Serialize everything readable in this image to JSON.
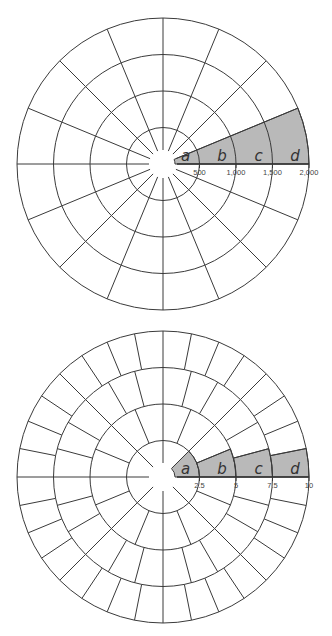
{
  "diagrams": [
    {
      "id": "equal-angle-grid",
      "center": [
        163,
        164
      ],
      "ring_radii_px": [
        36.5,
        73,
        109.5,
        146
      ],
      "gap_radius_px": 14,
      "spoke_divisions_per_ring": [
        16,
        16,
        16,
        16
      ],
      "shaded_sector_deg": [
        0,
        22.5
      ],
      "shaded_mode": "full-wedge",
      "segment_labels": [
        "a",
        "b",
        "c",
        "d"
      ],
      "scale_labels": [
        "500",
        "1,000",
        "1,500",
        "2,000"
      ]
    },
    {
      "id": "equal-area-grid",
      "center": [
        163,
        477
      ],
      "ring_radii_px": [
        36.5,
        73,
        109.5,
        146
      ],
      "gap_radius_px": 14,
      "spoke_divisions_per_ring": [
        8,
        16,
        24,
        32
      ],
      "shaded_sector_deg": [
        0,
        45
      ],
      "shaded_mode": "first-cell-per-ring",
      "segment_labels": [
        "a",
        "b",
        "c",
        "d"
      ],
      "scale_labels": [
        "2.5",
        "5",
        "7.5",
        "10"
      ]
    }
  ],
  "colors": {
    "line": "#3a3a3a",
    "shade": "#b9b9b9",
    "background": "#ffffff"
  }
}
